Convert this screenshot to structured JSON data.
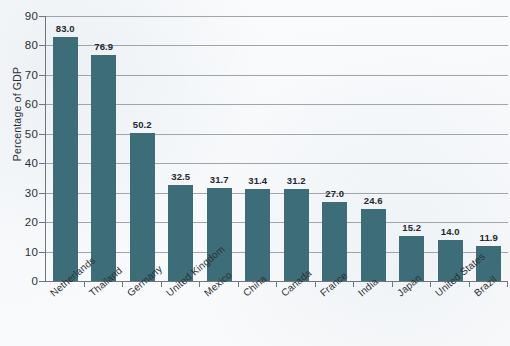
{
  "chart_data": {
    "type": "bar",
    "title": "",
    "subtitle": "",
    "xlabel": "",
    "ylabel": "Percentage of GDP",
    "ylim": [
      0,
      90
    ],
    "ytick_step": 10,
    "yticks": [
      "0",
      "10",
      "20",
      "30",
      "40",
      "50",
      "60",
      "70",
      "80",
      "90"
    ],
    "grid": true,
    "grid_axis": "y",
    "legend": false,
    "legend_position": "none",
    "bar_color": "#3c6d79",
    "categories": [
      "Netherlands",
      "Thailand",
      "Germany",
      "United Kingdom",
      "Mexico",
      "China",
      "Canada",
      "France",
      "India",
      "Japan",
      "United States",
      "Brazil"
    ],
    "values": [
      83.0,
      76.9,
      50.2,
      32.5,
      31.7,
      31.4,
      31.2,
      27.0,
      24.6,
      15.2,
      14.0,
      11.9
    ],
    "value_labels": [
      "83.0",
      "76.9",
      "50.2",
      "32.5",
      "31.7",
      "31.4",
      "31.2",
      "27.0",
      "24.6",
      "15.2",
      "14.0",
      "11.9"
    ]
  },
  "axes": {
    "y_title": "Percentage of GDP"
  },
  "colors": {
    "bar": "#3c6d79",
    "gridline": "#9ea5ab",
    "axis": "#6f767c",
    "text": "#2b3034",
    "background": "#f8fafb"
  }
}
